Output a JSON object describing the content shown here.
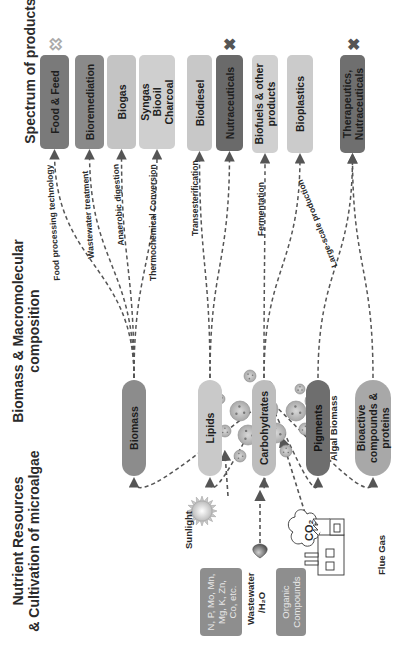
{
  "headings": {
    "nutrient": "Nutrient Resources\n& Cultivation of microalgae",
    "composition": "Biomass & Macromolecular\ncomposition",
    "products": "Spectrum of products"
  },
  "resources": {
    "minerals": "N, P, Mo, Mn,\nMg, K, Zn,\nCo, etc.",
    "wastewater": "Wastewater",
    "water": "/H₂O",
    "organic": "Organic\nCompounds",
    "sunlight": "Sunlight",
    "co2": "CO₂",
    "flue_gas": "Flue Gas",
    "algal_biomass": "Algal Biomass"
  },
  "composition": [
    {
      "label": "Biomass",
      "color": "#8c8c8c"
    },
    {
      "label": "Lipids",
      "color": "#c9c9c9"
    },
    {
      "label": "Carbohydrates",
      "color": "#bdbdbd"
    },
    {
      "label": "Pigments",
      "color": "#6e6e6e"
    },
    {
      "label": "Bioactive\ncompounds &\nproteins",
      "color": "#a8a8a8"
    }
  ],
  "processes": [
    "Food processing technology",
    "Wastewater treatment",
    "Anaerobic digestion",
    "Thermochemical Conversion",
    "Transesterification",
    "Fermentation",
    "Large-scale production"
  ],
  "products": [
    {
      "label": "Food & Feed",
      "color": "#7a7a7a",
      "mark": "outline-x"
    },
    {
      "label": "Bioremediation",
      "color": "#8a8a8a",
      "mark": ""
    },
    {
      "label": "Biogas",
      "color": "#c4c4c4",
      "mark": ""
    },
    {
      "label": "Syngas\nBiooil\nCharcoal",
      "color": "#cfcfcf",
      "mark": ""
    },
    {
      "label": "Biodiesel",
      "color": "#c8c8c8",
      "mark": ""
    },
    {
      "label": "Nutraceuticals",
      "color": "#6a6a6a",
      "mark": "solid-x"
    },
    {
      "label": "Biofuels & other\nproducts",
      "color": "#d0d0d0",
      "mark": ""
    },
    {
      "label": "Bioplastics",
      "color": "#cbcbcb",
      "mark": ""
    },
    {
      "label": "Therapeutics,\nNutraceuticals",
      "color": "#6f6f6f",
      "mark": "solid-x"
    }
  ],
  "marks": {
    "outline": "✖",
    "solid": "✖"
  }
}
